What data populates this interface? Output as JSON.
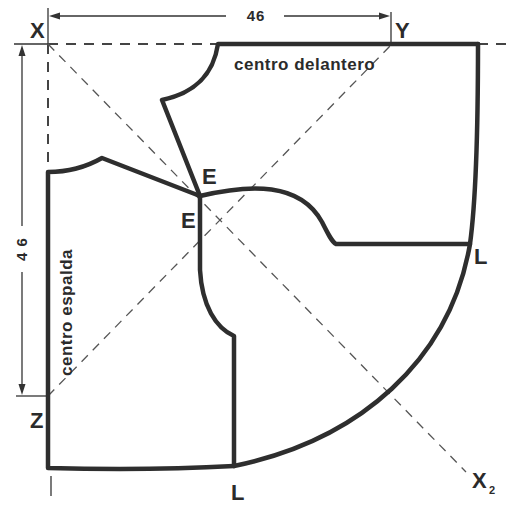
{
  "diagram": {
    "type": "sewing-pattern",
    "points": {
      "x": "X",
      "y": "Y",
      "z": "Z",
      "e_front": "E",
      "e_back": "E",
      "l_right": "L",
      "l_bottom": "L",
      "x2_main": "X",
      "x2_sub": "2"
    },
    "labels": {
      "front_center": "centro delantero",
      "back_center": "centro espalda"
    },
    "dimensions": {
      "horizontal": "46",
      "vertical": "4 6"
    },
    "colors": {
      "ink": "#2e2e2e",
      "background": "#ffffff"
    }
  }
}
